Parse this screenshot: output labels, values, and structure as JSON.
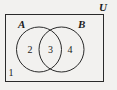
{
  "diagram": {
    "type": "venn-diagram",
    "title_label": "U",
    "universe": {
      "label": "U",
      "description": "universal-set-rectangle"
    },
    "sets": [
      {
        "key": "A",
        "label": "A",
        "position": "top-left"
      },
      {
        "key": "B",
        "label": "B",
        "position": "top-right"
      }
    ],
    "regions": [
      {
        "key": "outside",
        "label": "1",
        "meaning": "outside-both-sets"
      },
      {
        "key": "a-only",
        "label": "2",
        "meaning": "A-only"
      },
      {
        "key": "intersection",
        "label": "3",
        "meaning": "A-intersect-B"
      },
      {
        "key": "b-only",
        "label": "4",
        "meaning": "B-only"
      }
    ],
    "colors": {
      "background": "#f2f1ef",
      "stroke": "#2a2a2a",
      "text": "#1b1b1b"
    }
  }
}
